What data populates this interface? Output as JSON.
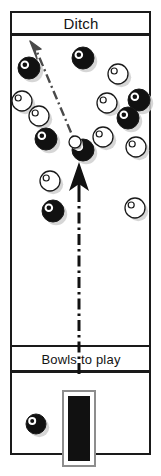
{
  "diagram": {
    "labels": {
      "ditch": "Ditch",
      "bowls_to_play": "Bowls to play"
    },
    "colors": {
      "black_bowl": "#111111",
      "white_bowl": "#ffffff",
      "outline": "#1a1a1a",
      "shadow": "#cfcfcf",
      "arrow_solid": "#111111",
      "arrow_dashed": "#4a4a4a",
      "mat": "#111111",
      "background": "#ffffff"
    },
    "sections": [
      {
        "name": "ditch-band",
        "label": "Ditch",
        "y": 12,
        "height": 22
      },
      {
        "name": "head-area",
        "label": "",
        "y": 34,
        "height": 312
      },
      {
        "name": "bowls-to-play-band",
        "label": "Bowls to play",
        "y": 346,
        "height": 24
      },
      {
        "name": "delivery-area",
        "label": "",
        "y": 370,
        "height": 84
      }
    ],
    "mat": {
      "name": "mat",
      "x": 64,
      "y": 392,
      "width": 30,
      "height": 72
    },
    "jack": {
      "name": "jack",
      "cx": 75,
      "cy": 142,
      "r": 6
    },
    "bowls": [
      {
        "id": 1,
        "color": "black",
        "cx": 29,
        "cy": 68,
        "r": 11
      },
      {
        "id": 2,
        "color": "black",
        "cx": 83,
        "cy": 58,
        "r": 11
      },
      {
        "id": 3,
        "color": "white",
        "cx": 22,
        "cy": 101,
        "r": 10
      },
      {
        "id": 4,
        "color": "white",
        "cx": 118,
        "cy": 74,
        "r": 10
      },
      {
        "id": 5,
        "color": "white",
        "cx": 39,
        "cy": 116,
        "r": 10
      },
      {
        "id": 6,
        "color": "white",
        "cx": 107,
        "cy": 103,
        "r": 10
      },
      {
        "id": 7,
        "color": "black",
        "cx": 139,
        "cy": 100,
        "r": 11
      },
      {
        "id": 8,
        "color": "black",
        "cx": 46,
        "cy": 139,
        "r": 11
      },
      {
        "id": 9,
        "color": "black",
        "cx": 128,
        "cy": 118,
        "r": 11
      },
      {
        "id": 10,
        "color": "white",
        "cx": 103,
        "cy": 137,
        "r": 10
      },
      {
        "id": 11,
        "color": "black",
        "cx": 83,
        "cy": 150,
        "r": 11
      },
      {
        "id": 12,
        "color": "white",
        "cx": 136,
        "cy": 147,
        "r": 10
      },
      {
        "id": 13,
        "color": "white",
        "cx": 50,
        "cy": 181,
        "r": 10
      },
      {
        "id": 14,
        "color": "black",
        "cx": 53,
        "cy": 211,
        "r": 11
      },
      {
        "id": 15,
        "color": "white",
        "cx": 135,
        "cy": 208,
        "r": 10
      },
      {
        "id": 16,
        "color": "black",
        "cx": 36,
        "cy": 424,
        "r": 10
      }
    ],
    "arrows": [
      {
        "name": "delivery-arrow-solid",
        "style": "solid-head-dashed-tail",
        "from": {
          "x": 79,
          "y": 370
        },
        "to": {
          "x": 79,
          "y": 162
        }
      },
      {
        "name": "running-line-arrow",
        "style": "dash-dot",
        "from": {
          "x": 79,
          "y": 150
        },
        "to": {
          "x": 33,
          "y": 42
        }
      }
    ]
  }
}
